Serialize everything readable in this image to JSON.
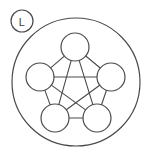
{
  "canvas": {
    "width": 146,
    "height": 157,
    "background_color": "#ffffff",
    "stroke_color": "#4a4a4a"
  },
  "badge": {
    "label": "L",
    "center_x": 22,
    "center_y": 21,
    "radius": 11,
    "text_color": "#3c3c3c",
    "fill_color": "#ffffff"
  },
  "outer_ring": {
    "center_x": 76,
    "center_y": 82,
    "radius": 64
  },
  "graph": {
    "node_radius": 14,
    "nodes": [
      {
        "id": "n1",
        "label": "",
        "cx": 75,
        "cy": 47
      },
      {
        "id": "n2",
        "label": "",
        "cx": 40,
        "cy": 77
      },
      {
        "id": "n3",
        "label": "",
        "cx": 111,
        "cy": 77
      },
      {
        "id": "n4",
        "label": "",
        "cx": 55,
        "cy": 118
      },
      {
        "id": "n5",
        "label": "",
        "cx": 97,
        "cy": 118
      }
    ],
    "edges": [
      {
        "from": "n1",
        "to": "n2"
      },
      {
        "from": "n1",
        "to": "n3"
      },
      {
        "from": "n2",
        "to": "n3"
      },
      {
        "from": "n2",
        "to": "n4"
      },
      {
        "from": "n3",
        "to": "n5"
      },
      {
        "from": "n4",
        "to": "n5"
      },
      {
        "from": "n1",
        "to": "n4"
      },
      {
        "from": "n1",
        "to": "n5"
      },
      {
        "from": "n2",
        "to": "n5"
      },
      {
        "from": "n3",
        "to": "n4"
      }
    ]
  }
}
